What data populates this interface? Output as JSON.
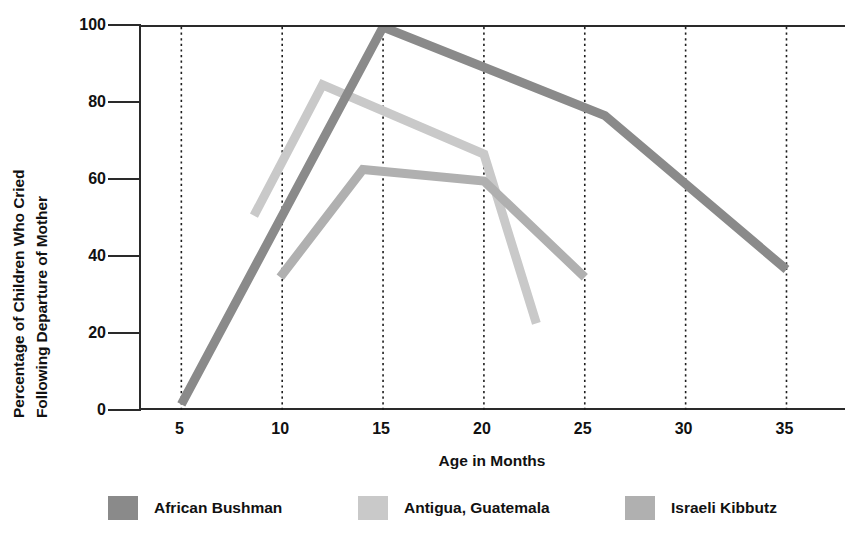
{
  "chart_data": {
    "type": "line",
    "title": "",
    "xlabel": "Age in Months",
    "ylabel": "Percentage of Children Who Cried Following Departure of Mother",
    "ylabel_line1": "Percentage of Children Who Cried",
    "ylabel_line2": "Following Departure of Mother",
    "xlim": [
      3,
      38
    ],
    "ylim": [
      0,
      100
    ],
    "xticks": [
      5,
      10,
      15,
      20,
      25,
      30,
      35
    ],
    "xtick_labels": [
      "5",
      "10",
      "15",
      "20",
      "25",
      "30",
      "35"
    ],
    "yticks": [
      0,
      20,
      40,
      60,
      80,
      100
    ],
    "ytick_labels": [
      "0",
      "20",
      "40",
      "60",
      "80",
      "100"
    ],
    "grid": "vertical-dotted",
    "legend_position": "below",
    "series": [
      {
        "name": "African Bushman",
        "color": "#8a8a8a",
        "x": [
          5,
          15,
          26,
          35
        ],
        "y": [
          2,
          100,
          77,
          37
        ]
      },
      {
        "name": "Antigua, Guatemala",
        "color": "#c9c9c9",
        "x": [
          8.6,
          12,
          20,
          22.6
        ],
        "y": [
          51,
          85,
          67,
          23
        ]
      },
      {
        "name": "Israeli Kibbutz",
        "color": "#b0b0b0",
        "x": [
          9.9,
          14,
          20,
          25
        ],
        "y": [
          35,
          63,
          60,
          35
        ]
      }
    ]
  }
}
